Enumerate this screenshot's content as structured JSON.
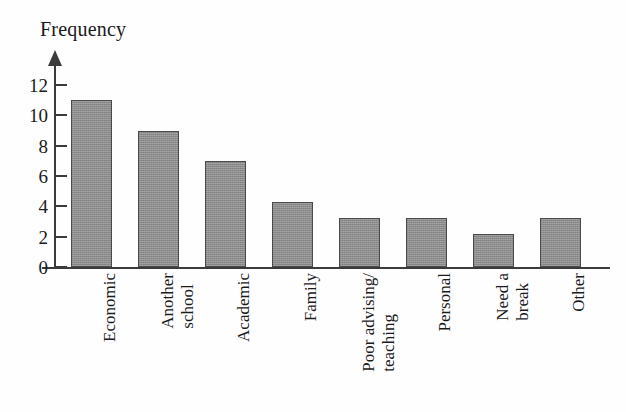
{
  "chart_data": {
    "type": "bar",
    "title": "",
    "ylabel": "Frequency",
    "xlabel": "",
    "categories": [
      "Economic",
      "Another school",
      "Academic",
      "Family",
      "Poor advising/ teaching",
      "Personal",
      "Need a break",
      "Other"
    ],
    "category_lines": [
      [
        "Economic"
      ],
      [
        "Another",
        "school"
      ],
      [
        "Academic"
      ],
      [
        "Family"
      ],
      [
        "Poor advising/",
        "teaching"
      ],
      [
        "Personal"
      ],
      [
        "Need a",
        "break"
      ],
      [
        "Other"
      ]
    ],
    "values": [
      11,
      9,
      7,
      4.3,
      3.2,
      3.2,
      2.2,
      3.2
    ],
    "ylim": [
      0,
      12
    ],
    "yticks": [
      0,
      2,
      4,
      6,
      8,
      10,
      12
    ],
    "ytick_labels": [
      "0",
      "2",
      "4",
      "6",
      "8",
      "10",
      "12"
    ],
    "grid": false,
    "legend": false,
    "bar_color": "#8c8c8c",
    "bar_border_color": "#4a4a4a",
    "axis_color": "#3b3b3b",
    "background_color": "#fefefe"
  }
}
